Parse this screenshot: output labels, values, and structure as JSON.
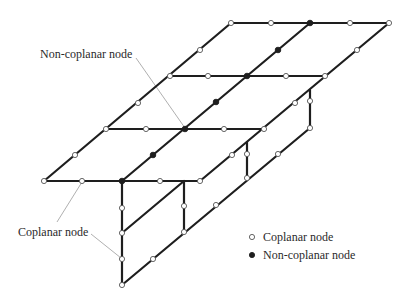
{
  "colors": {
    "background": "#ffffff",
    "member": "#1e1e1e",
    "leader": "#9a9a9a",
    "node_fill_coplanar": "#ffffff",
    "node_fill_noncoplanar": "#1e1e1e",
    "text": "#2a2a2a"
  },
  "annotations": {
    "noncoplanar_label": "Non-coplanar node",
    "coplanar_label": "Coplanar node"
  },
  "legend": {
    "items": [
      {
        "symbol": "open-circle",
        "label": "Coplanar node"
      },
      {
        "symbol": "filled-circle",
        "label": "Non-coplanar node"
      }
    ]
  },
  "members": [
    [
      231,
      23,
      389,
      23
    ],
    [
      170,
      76,
      325,
      76
    ],
    [
      106,
      129,
      264,
      129
    ],
    [
      44,
      181,
      200,
      181
    ],
    [
      44,
      181,
      231,
      23
    ],
    [
      122,
      181,
      310,
      23
    ],
    [
      200,
      181,
      389,
      23
    ],
    [
      122,
      181,
      122,
      285
    ],
    [
      184,
      181,
      184,
      232
    ],
    [
      247,
      142,
      247,
      178
    ],
    [
      310,
      90,
      310,
      128
    ],
    [
      122,
      233,
      184,
      181
    ],
    [
      122,
      285,
      310,
      128
    ]
  ],
  "leaders": [
    [
      136,
      58,
      185,
      128
    ],
    [
      82,
      182,
      57,
      222
    ],
    [
      91,
      234,
      121,
      258
    ]
  ],
  "nodes": {
    "coplanar": [
      [
        231,
        23
      ],
      [
        271,
        23
      ],
      [
        350,
        23
      ],
      [
        389,
        23
      ],
      [
        170,
        76
      ],
      [
        208,
        76
      ],
      [
        286,
        76
      ],
      [
        325,
        76
      ],
      [
        106,
        129
      ],
      [
        146,
        129
      ],
      [
        224,
        129
      ],
      [
        264,
        129
      ],
      [
        44,
        181
      ],
      [
        82,
        181
      ],
      [
        160,
        181
      ],
      [
        200,
        181
      ],
      [
        75,
        155
      ],
      [
        138,
        103
      ],
      [
        200,
        50
      ],
      [
        232,
        155
      ],
      [
        295,
        103
      ],
      [
        357,
        50
      ],
      [
        122,
        208
      ],
      [
        122,
        233
      ],
      [
        122,
        259
      ],
      [
        122,
        285
      ],
      [
        184,
        206
      ],
      [
        184,
        232
      ],
      [
        247,
        154
      ],
      [
        247,
        178
      ],
      [
        310,
        101
      ],
      [
        310,
        128
      ],
      [
        153,
        259
      ],
      [
        216,
        205
      ],
      [
        278,
        154
      ]
    ],
    "noncoplanar": [
      [
        310,
        23
      ],
      [
        247,
        76
      ],
      [
        185,
        129
      ],
      [
        122,
        181
      ],
      [
        153,
        155
      ],
      [
        216,
        102
      ],
      [
        278,
        50
      ]
    ]
  }
}
